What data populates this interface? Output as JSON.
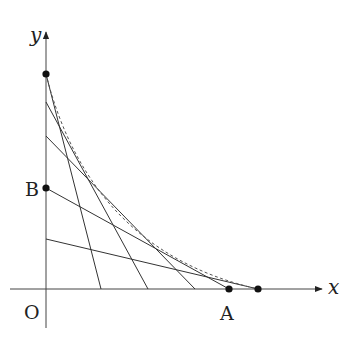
{
  "diagram": {
    "type": "geometry-envelope",
    "labels": {
      "origin": "O",
      "x_axis": "x",
      "y_axis": "y",
      "point_a": "A",
      "point_b": "B"
    },
    "axes": {
      "origin_px": [
        46,
        289
      ],
      "x_end_px": [
        322,
        289
      ],
      "x_start_px": [
        10,
        289
      ],
      "y_end_px": [
        46,
        32
      ],
      "y_start_px": [
        46,
        328
      ]
    },
    "segments": [
      {
        "y_intercept_px": 74,
        "x_intercept_px": 101
      },
      {
        "y_intercept_px": 102,
        "x_intercept_px": 148
      },
      {
        "y_intercept_px": 136,
        "x_intercept_px": 195
      },
      {
        "y_intercept_px": 188,
        "x_intercept_px": 229
      },
      {
        "y_intercept_px": 239,
        "x_intercept_px": 258
      }
    ],
    "points": [
      {
        "name": "top-y-point",
        "px": [
          46,
          74
        ]
      },
      {
        "name": "B",
        "px": [
          46,
          188
        ]
      },
      {
        "name": "A",
        "px": [
          229,
          289
        ]
      },
      {
        "name": "right-x-point",
        "px": [
          258,
          289
        ]
      }
    ],
    "envelope": {
      "style": "dashed",
      "from_px": [
        46,
        74
      ],
      "to_px": [
        258,
        289
      ]
    },
    "colors": {
      "line": "#333333",
      "dashed": "#555555",
      "point": "#111111"
    }
  }
}
